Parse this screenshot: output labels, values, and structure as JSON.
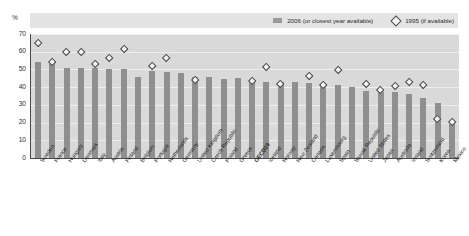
{
  "axis": {
    "unit_label": "%",
    "yticks": [
      0,
      10,
      20,
      30,
      40,
      50,
      60,
      70
    ]
  },
  "legend": {
    "bar_label": "2006 (or closest year available)",
    "diamond_label": "1995 (if available)",
    "bar_icon": "filled-square-icon",
    "diamond_icon": "open-diamond-icon"
  },
  "colors": {
    "bar": "#8f8f8f",
    "plot_background": "#d9d9d9",
    "legend_band": "#e3e3e3",
    "axis": "#4a4a4a",
    "marker_fill": "#f4f4f4",
    "marker_stroke": "#3f3f3f"
  },
  "chart_data": {
    "type": "bar",
    "title": "",
    "subtitle": "",
    "xlabel": "",
    "ylabel": "%",
    "ylim": [
      0,
      70
    ],
    "yticks": [
      0,
      10,
      20,
      30,
      40,
      50,
      60,
      70
    ],
    "grid": true,
    "legend_position": "top-right",
    "categories": [
      "Sweden",
      "France",
      "Hungary",
      "Denmark",
      "Italy",
      "Austria",
      "Finland",
      "Belgium",
      "Portugal",
      "Netherlands",
      "Germany",
      "United Kingdom",
      "Czech Republic",
      "Poland",
      "Greece",
      "OECD29",
      "Iceland",
      "Norway",
      "New Zealand",
      "Canada",
      "Luxembourg",
      "Spain",
      "Slovak Republic",
      "United States",
      "Japan",
      "Australia",
      "Ireland",
      "Switzerland",
      "Korea",
      "Mexico"
    ],
    "highlight_category": "OECD29",
    "series": [
      {
        "name": "2006 (or closest year available)",
        "type": "bar",
        "values": [
          54,
          54,
          51,
          51,
          51,
          50,
          50,
          46,
          49,
          48.5,
          48,
          45.5,
          45.5,
          44.5,
          45,
          43,
          43,
          43,
          43,
          42.5,
          41,
          41,
          40,
          38,
          37,
          37,
          36,
          34,
          31,
          19
        ]
      },
      {
        "name": "1995 (if available)",
        "type": "scatter",
        "marker": "open-diamond",
        "values": [
          65,
          54,
          60,
          59.5,
          53,
          56.5,
          61.5,
          null,
          52,
          56.5,
          null,
          44,
          null,
          null,
          null,
          43.5,
          51,
          41.5,
          null,
          46,
          41,
          49.5,
          null,
          41.5,
          38.5,
          40.5,
          43,
          41,
          22,
          20
        ]
      }
    ]
  }
}
